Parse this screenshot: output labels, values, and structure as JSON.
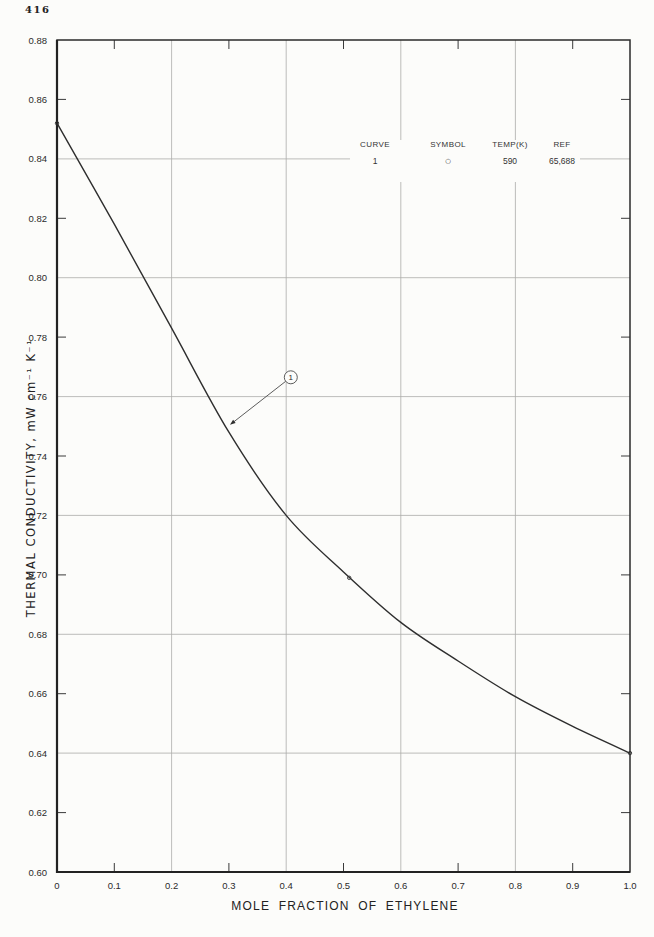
{
  "page": {
    "number": "416"
  },
  "legend": {
    "columns": [
      {
        "header": "CURVE",
        "value": "1"
      },
      {
        "header": "SYMBOL",
        "value": "○"
      },
      {
        "header": "TEMP(K)",
        "value": "590"
      },
      {
        "header": "REF",
        "value": "65,688"
      }
    ]
  },
  "chart_data": {
    "type": "line",
    "title": "",
    "xlabel": "MOLE FRACTION OF ETHYLENE",
    "ylabel": "THERMAL CONDUCTIVITY, mW cm⁻¹ K⁻¹",
    "xlim": [
      0,
      1.0
    ],
    "ylim": [
      0.6,
      0.88
    ],
    "x_tick_step": 0.1,
    "y_tick_step": 0.02,
    "x_grid_values": [
      0.2,
      0.4,
      0.6,
      0.8
    ],
    "y_grid_values": [
      0.64,
      0.68,
      0.72,
      0.76,
      0.8,
      0.84
    ],
    "x_minor_tick_values": [
      0.1,
      0.3,
      0.5,
      0.7,
      0.9
    ],
    "y_minor_tick_values": [
      0.62,
      0.66,
      0.7,
      0.74,
      0.78,
      0.82,
      0.86
    ],
    "grid": "major-on",
    "legend_position": "upper-right-inside",
    "series": [
      {
        "name": "1",
        "symbol": "○",
        "temp_K": "590",
        "ref": "65,688",
        "x": [
          0,
          0.1,
          0.2,
          0.3,
          0.4,
          0.5,
          0.6,
          0.7,
          0.8,
          0.9,
          1.0
        ],
        "y": [
          0.852,
          0.818,
          0.783,
          0.748,
          0.72,
          0.701,
          0.684,
          0.671,
          0.659,
          0.649,
          0.64
        ]
      }
    ],
    "data_points": [
      {
        "x": 0,
        "y": 0.852
      },
      {
        "x": 0.51,
        "y": 0.699
      },
      {
        "x": 1.0,
        "y": 0.64
      }
    ],
    "annotation": {
      "label": "1",
      "circle": {
        "x": 0.408,
        "y": 0.7665
      },
      "arrow_tip": {
        "x": 0.302,
        "y": 0.7505
      }
    }
  }
}
